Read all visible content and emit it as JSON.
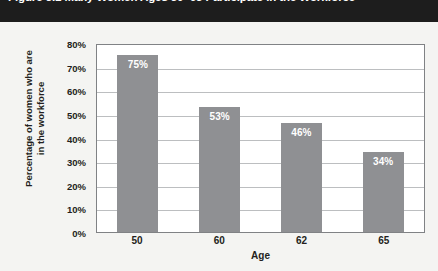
{
  "figure": {
    "title": "Figure 3.1 Many Women Ages 50–65 Participate in the Workforce",
    "title_clipped": true
  },
  "chart_data": {
    "type": "bar",
    "title": "Figure 3.1 Many Women Ages 50–65 Participate in the Workforce",
    "categories": [
      "50",
      "60",
      "62",
      "65"
    ],
    "values": [
      75,
      53,
      46,
      34
    ],
    "data_labels": [
      "75%",
      "53%",
      "46%",
      "34%"
    ],
    "xlabel": "Age",
    "ylabel": "Percentage of women who are in the workforce",
    "ylabel_line1": "Percentage of women who are",
    "ylabel_line2": "in the workforce",
    "ylim": [
      0,
      80
    ],
    "ytick_values": [
      0,
      10,
      20,
      30,
      40,
      50,
      60,
      70,
      80
    ],
    "ytick_labels": [
      "0%",
      "10%",
      "20%",
      "30%",
      "40%",
      "50%",
      "60%",
      "70%",
      "80%"
    ],
    "grid": "horizontal",
    "legend": "none",
    "series_color": "#8f9093",
    "label_color": "#ffffff",
    "grid_color": "#bcbec0",
    "axis_color": "#808285",
    "plot_background": "#ffffff",
    "page_background": "#f4f4f2",
    "title_band_color": "#1d1d1d"
  }
}
